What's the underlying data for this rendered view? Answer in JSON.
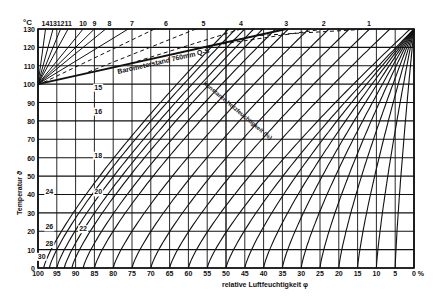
{
  "chart_data": {
    "type": "line",
    "title": "",
    "xlabel": "relative Luftfeuchtigkeit φ",
    "ylabel": "Temperatur ϑ",
    "y_unit": "°C",
    "x_unit": "%",
    "xlim": [
      100,
      0
    ],
    "ylim": [
      0,
      130
    ],
    "grid": true,
    "x_ticks": [
      "100",
      "95",
      "90",
      "85",
      "80",
      "75",
      "70",
      "65",
      "60",
      "55",
      "50",
      "45",
      "40",
      "35",
      "30",
      "25",
      "20",
      "15",
      "10",
      "5",
      "0 %"
    ],
    "y_ticks": [
      "0",
      "10",
      "20",
      "30",
      "40",
      "50",
      "60",
      "70",
      "80",
      "90",
      "100",
      "110",
      "120",
      "130"
    ],
    "top_curve_labels": [
      "14",
      "13",
      "12",
      "11",
      "10",
      "9",
      "8",
      "7",
      "6",
      "5",
      "4",
      "3",
      "2",
      "1"
    ],
    "inner_curve_labels": [
      "15",
      "16",
      "18",
      "20",
      "22",
      "24",
      "26",
      "28",
      "30"
    ],
    "annotations": [
      {
        "text": "Barometerstand 760mm Q-S",
        "type": "boundary_line"
      },
      {
        "text": "konstante Holzfeuchtigkeit (%)",
        "type": "curve_family_label"
      }
    ],
    "series_description": "Curves of constant wood moisture content (equilibrium moisture %) from 1 to 30 plotted against relative humidity (x) and temperature (y); dashed above the 760 mm barometric pressure line",
    "series": [
      {
        "name": "1",
        "top_x_at_130C": 12
      },
      {
        "name": "2",
        "top_x_at_130C": 24
      },
      {
        "name": "3",
        "top_x_at_130C": 34
      },
      {
        "name": "4",
        "top_x_at_130C": 46
      },
      {
        "name": "5",
        "top_x_at_130C": 58
      },
      {
        "name": "6",
        "top_x_at_130C": 69
      },
      {
        "name": "7",
        "top_x_at_130C": 76
      },
      {
        "name": "8",
        "top_x_at_130C": 82
      },
      {
        "name": "9",
        "top_x_at_130C": 85
      },
      {
        "name": "10",
        "top_x_at_130C": 88
      },
      {
        "name": "11",
        "top_x_at_130C": 92
      },
      {
        "name": "12",
        "top_x_at_130C": 94
      },
      {
        "name": "13",
        "top_x_at_130C": 96
      },
      {
        "name": "14",
        "top_x_at_130C": 98
      }
    ],
    "barometer_line": {
      "x": [
        100,
        34
      ],
      "y": [
        100,
        130
      ]
    }
  }
}
